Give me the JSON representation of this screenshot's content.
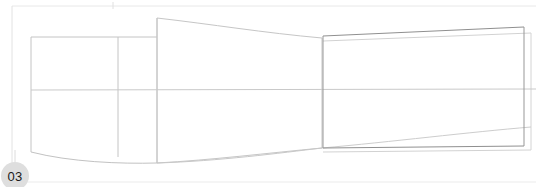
{
  "canvas": {
    "width": 536,
    "height": 187,
    "background": "#ffffff",
    "title": "Technical line drawing - side profile view"
  },
  "marker": {
    "label": "03",
    "shape": "circle",
    "fill_color": "#dedede",
    "text_color": "#1a1a1a",
    "center_x": 15,
    "center_y": 176,
    "radius": 14
  },
  "colors": {
    "frame_line": "#e3e3e3",
    "light_line": "#cfcfcf",
    "mid_line": "#bdbdbd",
    "dark_line": "#8c8c8c",
    "background": "#ffffff"
  },
  "geometry": {
    "frame": {
      "name": "sheet-frame",
      "color": "#e6e6e6",
      "top_y": 6,
      "left_x": 12,
      "bottom_y": 182,
      "right_x": 531
    },
    "centerline": {
      "name": "horizontal-centerline",
      "color": "#c8c8c8",
      "y": 90,
      "x_start": 31,
      "x_end": 531
    },
    "left_box": {
      "name": "left-section-box",
      "color": "#c4c4c4",
      "left_x": 31,
      "right_x": 118,
      "top_y": 37,
      "bottom_y": 156
    },
    "left_divider": {
      "name": "left-section-divider",
      "color": "#c4c4c4",
      "x": 118,
      "top_y": 37,
      "bottom_y": 157
    },
    "mid_taper": {
      "name": "mid-taper-outline",
      "color": "#c0c0c0",
      "left_x": 157,
      "right_x": 322,
      "left_top_y": 18,
      "left_bottom_y": 163,
      "right_top_y": 38,
      "right_bottom_y": 148
    },
    "right_rect": {
      "name": "right-dark-rectangle",
      "color": "#8c8c8c",
      "left_x": 323,
      "right_x": 524,
      "left_top_y": 36,
      "right_top_y": 27,
      "left_bottom_y": 148,
      "right_bottom_y": 146
    },
    "right_ghost": {
      "name": "right-ghost-outline",
      "color": "#cccccc",
      "left_x": 323,
      "right_x": 531,
      "left_top_y": 41,
      "right_top_y": 33,
      "left_bottom_y": 152,
      "right_bottom_y": 150
    },
    "hull_curve": {
      "name": "lower-hull-curve",
      "color": "#c2c2c2",
      "start_x": 31,
      "start_y": 152,
      "dip_x": 150,
      "dip_y": 163,
      "end_x": 531,
      "end_y": 128
    }
  }
}
